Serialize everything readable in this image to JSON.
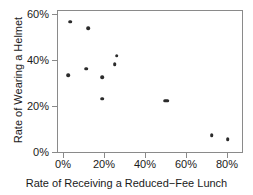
{
  "chart_data": {
    "type": "scatter",
    "title": "",
    "xlabel": "Rate of Receiving a Reduced−Fee Lunch",
    "ylabel": "Rate of Wearing a Helmet",
    "xlim": [
      -3,
      88
    ],
    "ylim": [
      -3,
      63
    ],
    "grid": false,
    "legend": null,
    "xtick_labels": [
      "0%",
      "20%",
      "40%",
      "60%",
      "80%"
    ],
    "xtick_values": [
      0,
      20,
      40,
      60,
      80
    ],
    "ytick_labels": [
      "0%",
      "20%",
      "40%",
      "60%"
    ],
    "ytick_values": [
      0,
      20,
      40,
      60
    ],
    "marker": {
      "shape": "circle",
      "color": "#2b2b2b",
      "size": 3.6
    },
    "points": [
      {
        "x": 3,
        "y": 58
      },
      {
        "x": 12,
        "y": 55
      },
      {
        "x": 26,
        "y": 42
      },
      {
        "x": 25,
        "y": 38
      },
      {
        "x": 11,
        "y": 36
      },
      {
        "x": 2,
        "y": 33
      },
      {
        "x": 19,
        "y": 32
      },
      {
        "x": 19,
        "y": 22
      },
      {
        "x": 50,
        "y": 21
      },
      {
        "x": 51,
        "y": 21
      },
      {
        "x": 73,
        "y": 5
      },
      {
        "x": 81,
        "y": 3
      }
    ]
  },
  "axis_titles": {
    "x": "Rate of Receiving a Reduced−Fee Lunch",
    "y": "Rate of Wearing a Helmet"
  },
  "colors": {
    "marker": "#2b2b2b",
    "frame": "#8a8a8a",
    "text": "#1a1a1a",
    "background": "#ffffff"
  }
}
